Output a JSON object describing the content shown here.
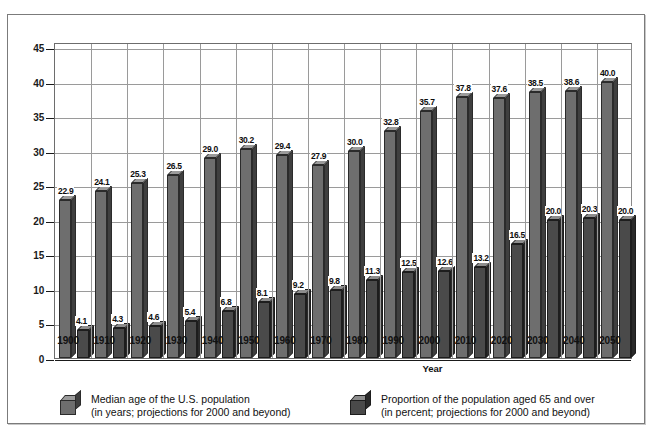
{
  "chart_data": {
    "type": "bar",
    "title": "",
    "xlabel": "Year",
    "ylabel": "",
    "ylim": [
      0,
      45
    ],
    "yticks": [
      0,
      5,
      10,
      15,
      20,
      25,
      30,
      35,
      40,
      45
    ],
    "grid": true,
    "legend_position": "bottom",
    "categories": [
      "1900",
      "1910",
      "1920",
      "1930",
      "1940",
      "1950",
      "1960",
      "1970",
      "1980",
      "1990",
      "2000",
      "2010",
      "2020",
      "2030",
      "2040",
      "2050"
    ],
    "series": [
      {
        "name": "Median age of the U.S. population",
        "unit": "years",
        "values": [
          22.9,
          24.1,
          25.3,
          26.5,
          29.0,
          30.2,
          29.4,
          27.9,
          30.0,
          32.8,
          35.7,
          37.8,
          37.6,
          38.5,
          38.6,
          40.0
        ],
        "labels": [
          "22.9",
          "24.1",
          "25.3",
          "26.5",
          "29.0",
          "30.2",
          "29.4",
          "27.9",
          "30.0",
          "32.8",
          "35.7",
          "37.8",
          "37.6",
          "38.5",
          "38.6",
          "40.0"
        ],
        "color": "#6e6e6e"
      },
      {
        "name": "Proportion of the population aged 65 and over",
        "unit": "percent",
        "values": [
          4.1,
          4.3,
          4.6,
          5.4,
          6.8,
          8.1,
          9.2,
          9.8,
          11.3,
          12.5,
          12.6,
          13.2,
          16.5,
          20.0,
          20.3,
          20.0
        ],
        "labels": [
          "4.1",
          "4.3",
          "4.6",
          "5.4",
          "6.8",
          "8.1",
          "9.2",
          "9.8",
          "11.3",
          "12.5",
          "12.6",
          "13.2",
          "16.5",
          "20.0",
          "20.3",
          "20.0"
        ],
        "color": "#4a4a4a"
      }
    ]
  },
  "axis": {
    "x_title": "Year",
    "y_ticks": [
      "45",
      "40",
      "35",
      "30",
      "25",
      "20",
      "15",
      "10",
      "5",
      "0"
    ],
    "x_ticks": [
      "1900",
      "1910",
      "1920",
      "1930",
      "1940",
      "1950",
      "1960",
      "1970",
      "1980",
      "1990",
      "2000",
      "2010",
      "2020",
      "2030",
      "2040",
      "2050"
    ]
  },
  "legend": {
    "items": [
      {
        "line1": "Median age of the U.S. population",
        "line2": "(in years; projections for 2000 and beyond)",
        "swatch": "median-swatch-icon"
      },
      {
        "line1": "Proportion of the population aged 65 and over",
        "line2": "(in percent; projections for 2000 and beyond)",
        "swatch": "proportion-swatch-icon"
      }
    ]
  },
  "colors": {
    "median_face": "#6e6e6e",
    "median_top": "#9b9b9b",
    "median_side": "#3f3f3f",
    "proportion_face": "#4a4a4a",
    "proportion_top": "#8d8d8d",
    "proportion_side": "#2a2a2a",
    "grid": "#9a9a9a",
    "frame": "#7b7b7b",
    "background": "#ffffff"
  }
}
